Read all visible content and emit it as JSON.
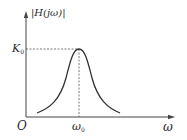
{
  "diagram": {
    "type": "bandpass filter magnitude response",
    "y_axis_label": "|H(jω)|",
    "x_axis_label": "ω",
    "origin_label": "O",
    "peak_value_label": {
      "main": "K",
      "sub": "0"
    },
    "center_frequency_label": {
      "main": "ω",
      "sub": "0"
    },
    "colors": {
      "axes": "#444444",
      "curve": "#333333",
      "dashed_guides": "#555555",
      "background": "#ffffff"
    }
  }
}
